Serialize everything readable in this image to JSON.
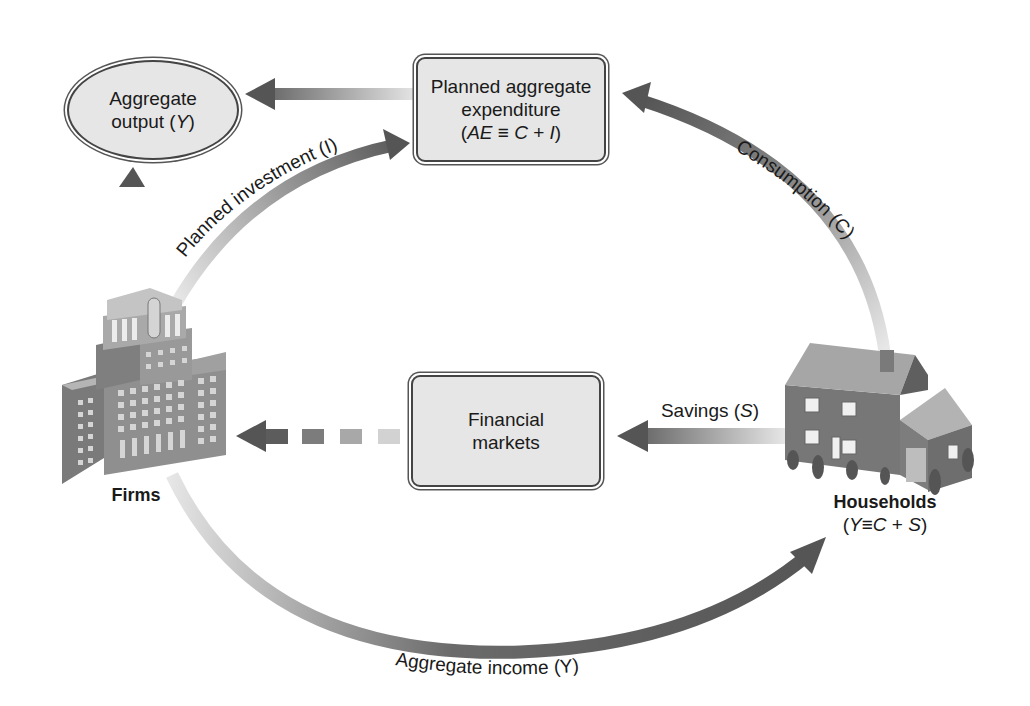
{
  "nodes": {
    "aggregate_output": {
      "line1": "Aggregate",
      "line2_prefix": "output (",
      "line2_var": "Y",
      "line2_suffix": ")"
    },
    "planned_expenditure": {
      "line1": "Planned aggregate",
      "line2": "expenditure",
      "line3_open": "(",
      "line3_ae": "AE",
      "line3_mid": " ≡ ",
      "line3_c": "C",
      "line3_plus": " + ",
      "line3_i": "I",
      "line3_close": ")"
    },
    "financial_markets": {
      "line1": "Financial",
      "line2": "markets"
    },
    "firms": {
      "label": "Firms"
    },
    "households": {
      "label": "Households",
      "identity_open": "(",
      "identity_y": "Y",
      "identity_eq": "≡",
      "identity_c": "C",
      "identity_plus": " + ",
      "identity_s": "S",
      "identity_close": ")"
    }
  },
  "flows": {
    "planned_investment": {
      "label": "Planned investment (I)"
    },
    "consumption": {
      "label": "Consumption (C)"
    },
    "savings": {
      "label_prefix": "Savings (",
      "label_var": "S",
      "label_suffix": ")"
    },
    "aggregate_income": {
      "label": "Aggregate income (Y)"
    }
  },
  "colors": {
    "arrow_dark": "#5a5a5a",
    "arrow_light": "#dcdcdc",
    "box_fill": "#e6e6e6",
    "box_border": "#444444"
  }
}
